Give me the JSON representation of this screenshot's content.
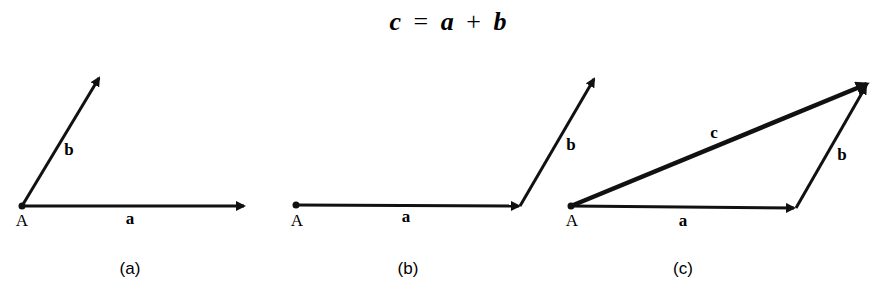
{
  "title": {
    "lhs": "c",
    "eq": "=",
    "a": "a",
    "plus": "+",
    "b": "b"
  },
  "colors": {
    "ink": "#111111",
    "background": "#ffffff"
  },
  "panels": [
    {
      "id": "a",
      "caption": "(a)",
      "origin_label": "A",
      "vectors": [
        {
          "name": "a",
          "label": "a"
        },
        {
          "name": "b",
          "label": "b"
        }
      ]
    },
    {
      "id": "b",
      "caption": "(b)",
      "origin_label": "A",
      "vectors": [
        {
          "name": "a",
          "label": "a"
        },
        {
          "name": "b",
          "label": "b"
        }
      ]
    },
    {
      "id": "c",
      "caption": "(c)",
      "origin_label": "A",
      "vectors": [
        {
          "name": "a",
          "label": "a"
        },
        {
          "name": "b",
          "label": "b"
        },
        {
          "name": "c",
          "label": "c"
        }
      ]
    }
  ]
}
